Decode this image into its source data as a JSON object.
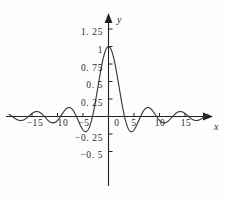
{
  "chart_data": {
    "type": "line",
    "title": "",
    "subtitle": "",
    "xlabel": "x",
    "ylabel": "y",
    "function": "sin(x)/x",
    "grid": false,
    "legend": null,
    "xlim": [
      -19.5,
      19.5
    ],
    "ylim": [
      -0.62,
      1.38
    ],
    "x_ticks": [
      -15,
      -10,
      -5,
      0,
      5,
      10,
      15
    ],
    "x_tick_labels": [
      "−15",
      "−10",
      "−5",
      "0",
      "5",
      "10",
      "15"
    ],
    "y_ticks": [
      1.25,
      1,
      0.75,
      0.5,
      0.25,
      -0.25,
      -0.5
    ],
    "y_tick_labels": [
      "1. 25",
      "1",
      "0. 75",
      "0. 5",
      "0. 25",
      "−0. 25",
      "−0. 5"
    ],
    "series": [
      {
        "name": "sinc",
        "color": "#3a3a3a",
        "x": [
          -19.5,
          -19.0,
          -18.5,
          -18.0,
          -17.5,
          -17.0,
          -16.5,
          -16.0,
          -15.5,
          -15.0,
          -14.5,
          -14.0,
          -13.5,
          -13.0,
          -12.5,
          -12.0,
          -11.5,
          -11.0,
          -10.5,
          -10.0,
          -9.5,
          -9.0,
          -8.5,
          -8.0,
          -7.5,
          -7.0,
          -6.5,
          -6.0,
          -5.5,
          -5.0,
          -4.5,
          -4.0,
          -3.5,
          -3.0,
          -2.5,
          -2.0,
          -1.5,
          -1.0,
          -0.5,
          0.0,
          0.5,
          1.0,
          1.5,
          2.0,
          2.5,
          3.0,
          3.5,
          4.0,
          4.5,
          5.0,
          5.5,
          6.0,
          6.5,
          7.0,
          7.5,
          8.0,
          8.5,
          9.0,
          9.5,
          10.0,
          10.5,
          11.0,
          11.5,
          12.0,
          12.5,
          13.0,
          13.5,
          14.0,
          14.5,
          15.0,
          15.5,
          16.0,
          16.5,
          17.0,
          17.5,
          18.0,
          18.5,
          19.0,
          19.5
        ],
        "y": [
          0.0312,
          0.0079,
          -0.0161,
          -0.0417,
          -0.0557,
          -0.0566,
          -0.0437,
          -0.0179,
          0.0164,
          0.0434,
          0.0684,
          0.0708,
          0.0496,
          0.0323,
          -0.0053,
          -0.0447,
          -0.0707,
          -0.0909,
          -0.0842,
          -0.0544,
          -0.0079,
          0.0458,
          0.0912,
          0.1237,
          0.1251,
          0.0939,
          0.0338,
          -0.0466,
          -0.1272,
          -0.1918,
          -0.2172,
          -0.1892,
          -0.1002,
          0.047,
          0.2394,
          0.4546,
          0.665,
          0.8415,
          0.9589,
          1.0,
          0.9589,
          0.8415,
          0.665,
          0.4546,
          0.2394,
          0.047,
          -0.1002,
          -0.1892,
          -0.2172,
          -0.1918,
          -0.1272,
          -0.0466,
          0.0338,
          0.0939,
          0.1251,
          0.1237,
          0.0912,
          0.0458,
          -0.0079,
          -0.0544,
          -0.0842,
          -0.0909,
          -0.0707,
          -0.0447,
          -0.0053,
          0.0323,
          0.0496,
          0.0708,
          0.0684,
          0.0434,
          0.0164,
          -0.0179,
          -0.0437,
          -0.0566,
          -0.0557,
          -0.0417,
          -0.0161,
          0.0079,
          0.0312
        ]
      }
    ],
    "annotations": []
  },
  "axes": {
    "y_axis_name": "y",
    "x_axis_name": "x"
  },
  "style": {
    "curve_color": "#3a3a3a",
    "axis_color": "#222222",
    "text_color": "#2b2b2b",
    "background": "#fdfdfd"
  }
}
